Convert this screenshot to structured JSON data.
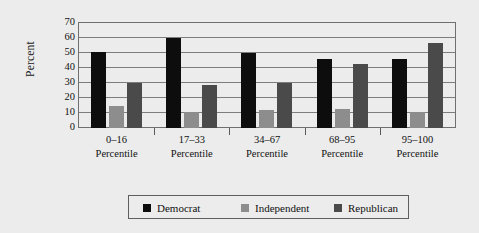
{
  "chart_data": {
    "type": "bar",
    "title": "",
    "xlabel": "",
    "ylabel": "Percent",
    "ylim": [
      0,
      70
    ],
    "yticks": [
      0,
      10,
      20,
      30,
      40,
      50,
      60,
      70
    ],
    "grid": true,
    "legend_position": "bottom",
    "categories": [
      "0–16 Percentile",
      "17–33 Percentile",
      "34–67 Percentile",
      "68–95 Percentile",
      "95–100 Percentile"
    ],
    "category_ranges": [
      "0–16",
      "17–33",
      "34–67",
      "68–95",
      "95–100"
    ],
    "category_unit": "Percentile",
    "series": [
      {
        "name": "Democrat",
        "color": "#0d0d0d",
        "values": [
          51,
          60,
          50,
          46,
          46
        ]
      },
      {
        "name": "Independent",
        "color": "#8d8d8d",
        "values": [
          15,
          11,
          12,
          13,
          11
        ]
      },
      {
        "name": "Republican",
        "color": "#4a4a4a",
        "values": [
          30,
          29,
          30,
          43,
          57
        ]
      }
    ]
  },
  "axis": {
    "y_label": "Percent",
    "y_ticks": [
      "70",
      "60",
      "50",
      "40",
      "30",
      "20",
      "10",
      "0"
    ]
  },
  "legend": {
    "items": [
      {
        "label": "Democrat"
      },
      {
        "label": "Independent"
      },
      {
        "label": "Republican"
      }
    ]
  },
  "xcategories": [
    {
      "range": "0–16",
      "unit": "Percentile"
    },
    {
      "range": "17–33",
      "unit": "Percentile"
    },
    {
      "range": "34–67",
      "unit": "Percentile"
    },
    {
      "range": "68–95",
      "unit": "Percentile"
    },
    {
      "range": "95–100",
      "unit": "Percentile"
    }
  ]
}
